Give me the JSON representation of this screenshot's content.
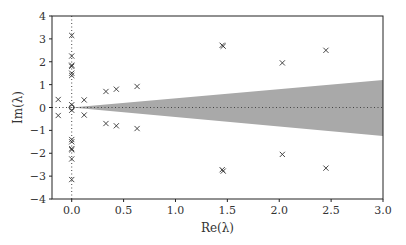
{
  "chart_data": {
    "type": "scatter",
    "title": "",
    "xlabel": "Re(λ)",
    "ylabel": "Im(λ)",
    "xlim": [
      -0.19,
      3.0
    ],
    "ylim": [
      -4,
      4
    ],
    "xticks": [
      0.0,
      0.5,
      1.0,
      1.5,
      2.0,
      2.5,
      3.0
    ],
    "xtick_labels": [
      "0.0",
      "0.5",
      "1.0",
      "1.5",
      "2.0",
      "2.5",
      "3.0"
    ],
    "yticks": [
      -4,
      -3,
      -2,
      -1,
      0,
      1,
      2,
      3,
      4
    ],
    "ytick_labels": [
      "−4",
      "−3",
      "−2",
      "−1",
      "0",
      "1",
      "2",
      "3",
      "4"
    ],
    "grid": false,
    "legend": null,
    "reference_lines": [
      {
        "orientation": "vertical",
        "at": 0,
        "style": "dotted"
      },
      {
        "orientation": "horizontal",
        "at": 0,
        "style": "dotted"
      }
    ],
    "shaded_region": {
      "description": "wedge from origin opening to the right",
      "color": "#a9a9a9",
      "apex": [
        0.0,
        0.0
      ],
      "right_edge_x": 3.0,
      "right_edge_upper": 1.2,
      "right_edge_lower": -1.25
    },
    "origin_marker": {
      "shape": "circle",
      "x": 0.0,
      "y": 0.0
    },
    "series": [
      {
        "name": "eigenvalues",
        "marker": "x",
        "color": "#333333",
        "points": [
          {
            "x": 0.0,
            "y": 3.15
          },
          {
            "x": 0.0,
            "y": -3.15
          },
          {
            "x": 0.0,
            "y": 2.25
          },
          {
            "x": 0.0,
            "y": -2.25
          },
          {
            "x": 0.0,
            "y": 1.85
          },
          {
            "x": 0.0,
            "y": -1.85
          },
          {
            "x": 0.0,
            "y": 1.8
          },
          {
            "x": 0.0,
            "y": -1.8
          },
          {
            "x": 0.0,
            "y": 1.5
          },
          {
            "x": 0.0,
            "y": -1.5
          },
          {
            "x": 0.0,
            "y": 1.4
          },
          {
            "x": 0.0,
            "y": -1.4
          },
          {
            "x": 0.0,
            "y": 0.12
          },
          {
            "x": 0.0,
            "y": -0.12
          },
          {
            "x": -0.13,
            "y": 0.35
          },
          {
            "x": -0.13,
            "y": -0.35
          },
          {
            "x": 0.12,
            "y": 0.33
          },
          {
            "x": 0.12,
            "y": -0.33
          },
          {
            "x": 0.33,
            "y": 0.7
          },
          {
            "x": 0.33,
            "y": -0.7
          },
          {
            "x": 0.43,
            "y": 0.8
          },
          {
            "x": 0.43,
            "y": -0.8
          },
          {
            "x": 0.63,
            "y": 0.92
          },
          {
            "x": 0.63,
            "y": -0.92
          },
          {
            "x": 1.45,
            "y": 2.72
          },
          {
            "x": 1.45,
            "y": -2.72
          },
          {
            "x": 1.46,
            "y": 2.68
          },
          {
            "x": 1.46,
            "y": -2.78
          },
          {
            "x": 2.03,
            "y": 1.95
          },
          {
            "x": 2.03,
            "y": -2.05
          },
          {
            "x": 2.45,
            "y": 2.5
          },
          {
            "x": 2.45,
            "y": -2.65
          }
        ]
      }
    ]
  }
}
